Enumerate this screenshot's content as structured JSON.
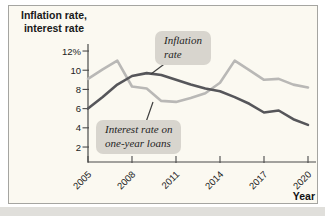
{
  "figure": {
    "ylabel_lines": [
      "Inflation rate,",
      "interest rate"
    ],
    "xlabel": "Year"
  },
  "chart_data": {
    "type": "line",
    "title": "",
    "xlabel": "Year",
    "ylabel": "Inflation rate, interest rate",
    "x": [
      2005,
      2006,
      2007,
      2008,
      2009,
      2010,
      2011,
      2012,
      2013,
      2014,
      2015,
      2016,
      2017,
      2018,
      2019,
      2020
    ],
    "x_tick_values": [
      2005,
      2008,
      2011,
      2014,
      2017,
      2020
    ],
    "x_tick_labels": [
      "2005",
      "2008",
      "2011",
      "2014",
      "2017",
      "2020"
    ],
    "y_tick_values": [
      2,
      4,
      6,
      8,
      10,
      12
    ],
    "y_tick_labels": [
      "2",
      "4",
      "6",
      "8",
      "10",
      "12%"
    ],
    "xlim": [
      2005,
      2020
    ],
    "ylim": [
      0.4,
      12.8
    ],
    "grid": false,
    "legend_position": "inline-callouts",
    "series": [
      {
        "name": "Inflation rate",
        "color": "#56565a",
        "values": [
          6.0,
          7.2,
          8.5,
          9.4,
          9.7,
          9.5,
          9.0,
          8.5,
          8.1,
          7.8,
          7.2,
          6.5,
          5.6,
          5.8,
          4.9,
          4.3
        ]
      },
      {
        "name": "Interest rate on one-year loans",
        "color": "#b9b8b6",
        "values": [
          9.1,
          10.1,
          11.0,
          8.3,
          8.1,
          6.8,
          6.7,
          7.1,
          7.6,
          8.7,
          11.0,
          10.0,
          9.0,
          9.1,
          8.5,
          8.2
        ]
      }
    ],
    "annotations": [
      {
        "target_series": "Inflation rate",
        "lines": [
          "Inflation",
          "rate"
        ]
      },
      {
        "target_series": "Interest rate on one-year loans",
        "lines": [
          "Interest rate on",
          "one-year loans"
        ]
      }
    ]
  },
  "colors": {
    "card_background": "#fbf9f1",
    "card_border": "#a5a5a1",
    "axis": "#4a4a4a",
    "tick_text": "#222222",
    "callout_background": "#d8d5ce",
    "callout_pointer": "#3f3f3f",
    "inflation_line": "#56565a",
    "interest_line": "#b9b8b6"
  }
}
